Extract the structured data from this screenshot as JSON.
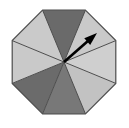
{
  "figure": {
    "kind": "umbrella-diagram",
    "canvas": {
      "width": 129,
      "height": 128,
      "background": "#ffffff"
    },
    "octagon": {
      "name": "octagon-canopy",
      "center": {
        "x": 64,
        "y": 62
      },
      "radius": 56,
      "rotation_deg": 22.5,
      "outline_color": "#4d4d4d",
      "outline_width": 1.2,
      "vertex_count": 8,
      "vertices": [
        {
          "x": 85.4,
          "y": 10.2
        },
        {
          "x": 115.8,
          "y": 40.6
        },
        {
          "x": 115.8,
          "y": 83.4
        },
        {
          "x": 85.4,
          "y": 113.8
        },
        {
          "x": 42.6,
          "y": 113.8
        },
        {
          "x": 12.2,
          "y": 83.4
        },
        {
          "x": 12.2,
          "y": 40.6
        },
        {
          "x": 42.6,
          "y": 10.2
        }
      ]
    },
    "wedges": [
      {
        "name": "wedge-top",
        "index": 1,
        "position": "top",
        "fill": "#c9c9c9",
        "tone": "light",
        "start_deg": -112.5,
        "end_deg": -67.5
      },
      {
        "name": "wedge-upper-right",
        "index": 2,
        "position": "upper-right",
        "fill": "#cfcfcf",
        "tone": "light",
        "start_deg": -67.5,
        "end_deg": -22.5
      },
      {
        "name": "wedge-right",
        "index": 3,
        "position": "right",
        "fill": "#c2c2c2",
        "tone": "light",
        "start_deg": -22.5,
        "end_deg": 22.5
      },
      {
        "name": "wedge-lower-right",
        "index": 4,
        "position": "lower-right",
        "fill": "#787878",
        "tone": "dark",
        "start_deg": 22.5,
        "end_deg": 67.5
      },
      {
        "name": "wedge-bottom",
        "index": 5,
        "position": "bottom",
        "fill": "#6b6b6b",
        "tone": "dark",
        "start_deg": 67.5,
        "end_deg": 112.5
      },
      {
        "name": "wedge-lower-left",
        "index": 6,
        "position": "lower-left",
        "fill": "#c9c9c9",
        "tone": "light",
        "start_deg": 112.5,
        "end_deg": 157.5
      },
      {
        "name": "wedge-left",
        "index": 7,
        "position": "left",
        "fill": "#cacaca",
        "tone": "light",
        "start_deg": 157.5,
        "end_deg": 202.5
      },
      {
        "name": "wedge-upper-left",
        "index": 8,
        "position": "upper-left",
        "fill": "#6a6a6a",
        "tone": "dark",
        "start_deg": 202.5,
        "end_deg": 247.5
      }
    ],
    "spokes": {
      "name": "canopy-spokes",
      "color": "#4d4d4d",
      "width": 1,
      "count": 8
    },
    "arrow": {
      "name": "direction-arrow",
      "color": "#000000",
      "from": {
        "x": 64,
        "y": 62
      },
      "to": {
        "x": 97,
        "y": 33
      },
      "shaft_width": 2.6,
      "head_length": 13,
      "head_width": 9,
      "bearing_deg": -41,
      "label": ""
    }
  }
}
